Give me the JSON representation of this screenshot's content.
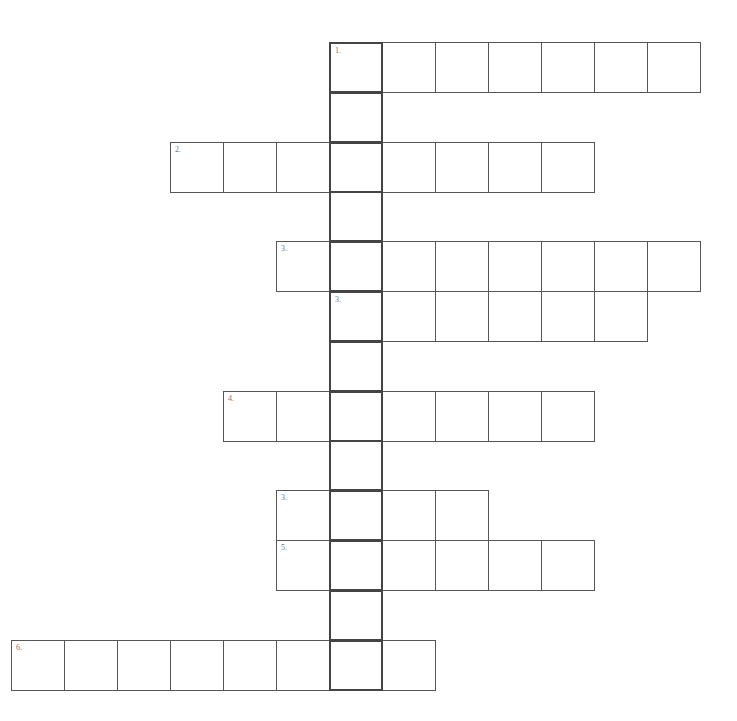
{
  "puzzle": {
    "origin": {
      "x": 11,
      "y": 42
    },
    "cell_w": 53,
    "cell_h": 49.8,
    "key_column": 6,
    "rows": [
      {
        "row": 0,
        "label": "1.",
        "start": 6,
        "end": 12
      },
      {
        "row": 1,
        "label": "",
        "start": 6,
        "end": 6
      },
      {
        "row": 2,
        "label": "2.",
        "start": 3,
        "end": 10
      },
      {
        "row": 3,
        "label": "",
        "start": 6,
        "end": 6
      },
      {
        "row": 4,
        "label": "3.",
        "start": 5,
        "end": 12
      },
      {
        "row": 5,
        "label": "3.",
        "start": 6,
        "end": 11
      },
      {
        "row": 6,
        "label": "",
        "start": 6,
        "end": 6
      },
      {
        "row": 7,
        "label": "4.",
        "start": 4,
        "end": 10
      },
      {
        "row": 8,
        "label": "",
        "start": 6,
        "end": 6
      },
      {
        "row": 9,
        "label": "3.",
        "start": 5,
        "end": 8
      },
      {
        "row": 10,
        "label": "5.",
        "start": 5,
        "end": 10
      },
      {
        "row": 11,
        "label": "",
        "start": 6,
        "end": 6
      },
      {
        "row": 12,
        "label": "6.",
        "start": 0,
        "end": 7
      }
    ]
  }
}
